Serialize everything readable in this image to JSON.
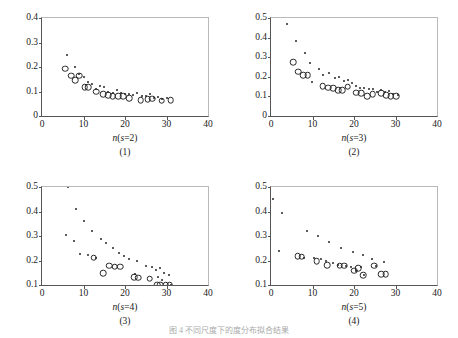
{
  "figure": {
    "caption": "图 4 不同尺度下的度分布拟合结果",
    "panel_count": 4
  },
  "chart_data": [
    {
      "type": "scatter",
      "title": "",
      "panel_number": "(1)",
      "xlabel": "n(s=2)",
      "xlabel_parts": {
        "prefix": "n",
        "open": "(",
        "var": "s",
        "eq": "=",
        "value": "2",
        "close": ")"
      },
      "ylabel": "",
      "xlim": [
        0,
        40
      ],
      "ylim": [
        0,
        0.4
      ],
      "xticks": [
        0,
        10,
        20,
        30,
        40
      ],
      "yticks": [
        "0",
        "0.1",
        "0.2",
        "0.3",
        "0.4"
      ],
      "ytick_values": [
        0,
        0.1,
        0.2,
        0.3,
        0.4
      ],
      "grid": false,
      "legend": "none",
      "series": [
        {
          "name": "dots",
          "marker": "filled-dot",
          "points": [
            [
              6.0,
              0.25
            ],
            [
              8.0,
              0.2
            ],
            [
              9.0,
              0.172
            ],
            [
              10.0,
              0.158
            ],
            [
              11.0,
              0.14
            ],
            [
              12.0,
              0.132
            ],
            [
              13.0,
              0.112
            ],
            [
              14.0,
              0.122
            ],
            [
              15.0,
              0.118
            ],
            [
              16.0,
              0.1
            ],
            [
              17.0,
              0.095
            ],
            [
              18.0,
              0.108
            ],
            [
              19.0,
              0.093
            ],
            [
              20.0,
              0.088
            ],
            [
              21.0,
              0.09
            ],
            [
              22.0,
              0.085
            ],
            [
              23.0,
              0.095
            ],
            [
              24.0,
              0.082
            ],
            [
              25.0,
              0.08
            ],
            [
              26.0,
              0.088
            ],
            [
              27.0,
              0.072
            ],
            [
              28.0,
              0.078
            ],
            [
              29.0,
              0.07
            ],
            [
              30.0,
              0.072
            ]
          ]
        },
        {
          "name": "circles",
          "marker": "open-circle",
          "points": [
            [
              5.6,
              0.193
            ],
            [
              7.0,
              0.165
            ],
            [
              8.0,
              0.146
            ],
            [
              9.0,
              0.165
            ],
            [
              10.3,
              0.118
            ],
            [
              11.2,
              0.118
            ],
            [
              13.0,
              0.1
            ],
            [
              14.8,
              0.088
            ],
            [
              16.0,
              0.085
            ],
            [
              17.0,
              0.082
            ],
            [
              18.3,
              0.082
            ],
            [
              19.5,
              0.08
            ],
            [
              21.0,
              0.072
            ],
            [
              23.8,
              0.065
            ],
            [
              25.5,
              0.068
            ],
            [
              26.5,
              0.07
            ],
            [
              28.8,
              0.062
            ],
            [
              31.0,
              0.065
            ]
          ]
        }
      ]
    },
    {
      "type": "scatter",
      "title": "",
      "panel_number": "(2)",
      "xlabel": "n(s=3)",
      "xlabel_parts": {
        "prefix": "n",
        "open": "(",
        "var": "s",
        "eq": "=",
        "value": "3",
        "close": ")"
      },
      "ylabel": "",
      "xlim": [
        0,
        40
      ],
      "ylim": [
        0,
        0.5
      ],
      "xticks": [
        0,
        10,
        20,
        30,
        40
      ],
      "yticks": [
        "0",
        "0.1",
        "0.2",
        "0.3",
        "0.4",
        "0.5"
      ],
      "ytick_values": [
        0,
        0.1,
        0.2,
        0.3,
        0.4,
        0.5
      ],
      "grid": false,
      "legend": "none",
      "series": [
        {
          "name": "dots",
          "marker": "filled-dot",
          "points": [
            [
              3.8,
              0.47
            ],
            [
              6.0,
              0.383
            ],
            [
              8.2,
              0.322
            ],
            [
              9.5,
              0.272
            ],
            [
              11.5,
              0.238
            ],
            [
              9.8,
              0.172
            ],
            [
              12.5,
              0.21
            ],
            [
              14.0,
              0.218
            ],
            [
              15.5,
              0.195
            ],
            [
              16.5,
              0.2
            ],
            [
              17.5,
              0.178
            ],
            [
              18.5,
              0.185
            ],
            [
              19.5,
              0.168
            ],
            [
              20.5,
              0.152
            ],
            [
              21.5,
              0.145
            ],
            [
              22.5,
              0.142
            ],
            [
              23.5,
              0.138
            ],
            [
              24.5,
              0.14
            ],
            [
              25.5,
              0.125
            ],
            [
              26.5,
              0.135
            ],
            [
              27.5,
              0.122
            ],
            [
              28.5,
              0.13
            ],
            [
              29.5,
              0.112
            ],
            [
              30.5,
              0.108
            ]
          ]
        },
        {
          "name": "circles",
          "marker": "open-circle",
          "points": [
            [
              5.3,
              0.275
            ],
            [
              6.5,
              0.225
            ],
            [
              7.8,
              0.208
            ],
            [
              8.8,
              0.208
            ],
            [
              12.5,
              0.152
            ],
            [
              13.8,
              0.145
            ],
            [
              15.0,
              0.142
            ],
            [
              16.2,
              0.132
            ],
            [
              17.2,
              0.132
            ],
            [
              18.5,
              0.15
            ],
            [
              20.5,
              0.118
            ],
            [
              21.8,
              0.115
            ],
            [
              23.2,
              0.102
            ],
            [
              24.5,
              0.112
            ],
            [
              26.5,
              0.115
            ],
            [
              27.8,
              0.105
            ],
            [
              28.8,
              0.102
            ],
            [
              30.2,
              0.1
            ]
          ]
        }
      ]
    },
    {
      "type": "scatter",
      "title": "",
      "panel_number": "(3)",
      "xlabel": "n(s=4)",
      "xlabel_parts": {
        "prefix": "n",
        "open": "(",
        "var": "s",
        "eq": "=",
        "value": "4",
        "close": ")"
      },
      "ylabel": "",
      "xlim": [
        0,
        40
      ],
      "ylim": [
        0.1,
        0.5
      ],
      "xticks": [
        0,
        10,
        20,
        30,
        40
      ],
      "yticks": [
        "0.1",
        "0.2",
        "0.3",
        "0.4",
        "0.5"
      ],
      "ytick_values": [
        0.1,
        0.2,
        0.3,
        0.4,
        0.5
      ],
      "grid": false,
      "legend": "none",
      "series": [
        {
          "name": "dots",
          "marker": "filled-dot",
          "points": [
            [
              6.2,
              0.5
            ],
            [
              8.2,
              0.412
            ],
            [
              10.2,
              0.362
            ],
            [
              12.0,
              0.32
            ],
            [
              14.2,
              0.288
            ],
            [
              15.5,
              0.272
            ],
            [
              17.0,
              0.252
            ],
            [
              18.5,
              0.232
            ],
            [
              5.8,
              0.305
            ],
            [
              7.8,
              0.278
            ],
            [
              9.2,
              0.225
            ],
            [
              11.2,
              0.222
            ],
            [
              13.0,
              0.212
            ],
            [
              19.8,
              0.218
            ],
            [
              21.0,
              0.205
            ],
            [
              23.0,
              0.198
            ],
            [
              25.0,
              0.178
            ],
            [
              26.5,
              0.172
            ],
            [
              27.5,
              0.162
            ],
            [
              28.5,
              0.168
            ],
            [
              29.5,
              0.15
            ],
            [
              30.5,
              0.142
            ],
            [
              28.0,
              0.132
            ],
            [
              29.0,
              0.122
            ],
            [
              31.0,
              0.102
            ],
            [
              22.5,
              0.145
            ]
          ]
        },
        {
          "name": "circles",
          "marker": "open-circle",
          "points": [
            [
              12.5,
              0.212
            ],
            [
              14.8,
              0.148
            ],
            [
              16.2,
              0.178
            ],
            [
              17.5,
              0.175
            ],
            [
              18.8,
              0.175
            ],
            [
              22.2,
              0.132
            ],
            [
              23.2,
              0.13
            ],
            [
              26.0,
              0.125
            ],
            [
              27.8,
              0.102
            ],
            [
              28.5,
              0.102
            ],
            [
              29.8,
              0.102
            ],
            [
              30.8,
              0.102
            ]
          ]
        }
      ]
    },
    {
      "type": "scatter",
      "title": "",
      "panel_number": "(4)",
      "xlabel": "n(s=5)",
      "xlabel_parts": {
        "prefix": "n",
        "open": "(",
        "var": "s",
        "eq": "=",
        "value": "5",
        "close": ")"
      },
      "ylabel": "",
      "xlim": [
        0,
        40
      ],
      "ylim": [
        0.1,
        0.5
      ],
      "xticks": [
        0,
        10,
        20,
        30,
        40
      ],
      "yticks": [
        "0.1",
        "0.2",
        "0.3",
        "0.4",
        "0.5"
      ],
      "ytick_values": [
        0.1,
        0.2,
        0.3,
        0.4,
        0.5
      ],
      "grid": false,
      "legend": "none",
      "series": [
        {
          "name": "dots",
          "marker": "filled-dot",
          "points": [
            [
              0.4,
              0.45
            ],
            [
              2.6,
              0.395
            ],
            [
              8.6,
              0.322
            ],
            [
              11.4,
              0.3
            ],
            [
              14.0,
              0.275
            ],
            [
              16.8,
              0.252
            ],
            [
              19.8,
              0.235
            ],
            [
              22.2,
              0.222
            ],
            [
              2.0,
              0.238
            ],
            [
              8.0,
              0.212
            ],
            [
              10.4,
              0.21
            ],
            [
              12.0,
              0.208
            ],
            [
              13.2,
              0.198
            ],
            [
              15.0,
              0.19
            ],
            [
              16.2,
              0.182
            ],
            [
              18.0,
              0.178
            ],
            [
              19.2,
              0.172
            ],
            [
              20.4,
              0.158
            ],
            [
              21.6,
              0.172
            ],
            [
              22.4,
              0.14
            ],
            [
              24.4,
              0.205
            ],
            [
              27.2,
              0.195
            ],
            [
              25.2,
              0.178
            ]
          ]
        },
        {
          "name": "circles",
          "marker": "open-circle",
          "points": [
            [
              6.4,
              0.218
            ],
            [
              7.4,
              0.215
            ],
            [
              11.0,
              0.198
            ],
            [
              13.6,
              0.18
            ],
            [
              16.6,
              0.178
            ],
            [
              17.6,
              0.178
            ],
            [
              20.0,
              0.158
            ],
            [
              21.0,
              0.168
            ],
            [
              22.2,
              0.14
            ],
            [
              24.8,
              0.178
            ],
            [
              26.6,
              0.145
            ],
            [
              27.6,
              0.145
            ]
          ]
        }
      ]
    }
  ]
}
